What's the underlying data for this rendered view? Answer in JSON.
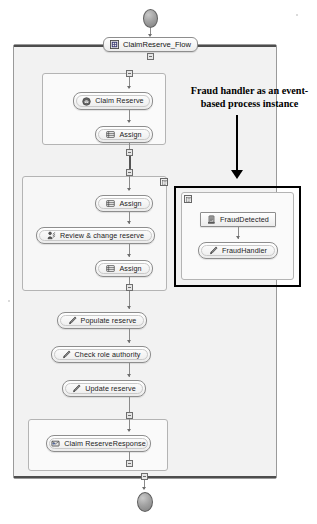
{
  "diagram": {
    "type": "bpmn-process-flow",
    "title": "ClaimReserve_Flow",
    "colors": {
      "pool_background": "#f2f2f2",
      "pool_border": "#9a9a9a",
      "task_border": "#8d8d8d",
      "highlight_border": "#000000",
      "event_fill": "#a3a3a3",
      "connector": "#8a8a8a"
    }
  },
  "start_event": {
    "name": "start-event",
    "label": ""
  },
  "end_event": {
    "name": "end-event",
    "label": ""
  },
  "flow_label": {
    "text": "ClaimReserve_Flow",
    "icon": "process-flow-icon"
  },
  "groups": {
    "receive_group": {
      "badge": "sub-process-marker"
    },
    "review_group": {
      "badge": "sub-process-marker"
    },
    "fraud_group": {
      "badge": "event-subprocess-marker"
    },
    "response_group": {
      "badge": "sub-process-marker"
    }
  },
  "nodes": [
    {
      "id": "claim-reserve",
      "label": "Claim Reserve",
      "icon": "receive-message-icon"
    },
    {
      "id": "assign-1",
      "label": "Assign",
      "icon": "assign-task-icon"
    },
    {
      "id": "assign-2",
      "label": "Assign",
      "icon": "assign-task-icon"
    },
    {
      "id": "review-change-reserve",
      "label": "Review & change reserve",
      "icon": "human-task-icon"
    },
    {
      "id": "assign-3",
      "label": "Assign",
      "icon": "assign-task-icon"
    },
    {
      "id": "populate-reserve",
      "label": "Populate reserve",
      "icon": "script-task-icon"
    },
    {
      "id": "check-role-authority",
      "label": "Check role authority",
      "icon": "script-task-icon"
    },
    {
      "id": "update-reserve",
      "label": "Update reserve",
      "icon": "script-task-icon"
    },
    {
      "id": "claim-reserve-response",
      "label": "Claim ReserveResponse",
      "icon": "reply-message-icon"
    },
    {
      "id": "fraud-detected",
      "label": "FraudDetected",
      "icon": "signal-event-icon"
    },
    {
      "id": "fraud-handler",
      "label": "FraudHandler",
      "icon": "script-task-icon"
    }
  ],
  "annotation": {
    "line1": "Fraud handler as an event-",
    "line2": "based process instance",
    "arrow": "down-arrow"
  }
}
